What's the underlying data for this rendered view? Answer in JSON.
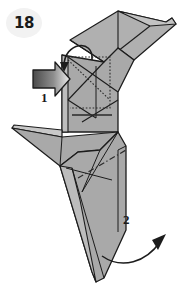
{
  "diagram": {
    "kind": "origami-folding-instruction",
    "step_badge": "18",
    "labels": [
      {
        "id": "label-1",
        "text": "1"
      },
      {
        "id": "label-2",
        "text": "2"
      }
    ],
    "icons": {
      "push_arrow": "push-arrow-icon",
      "fold_arrow": "curved-fold-arrow-icon",
      "swing_arrow": "curved-swing-arrow-icon"
    },
    "colors": {
      "background": "#ffffff",
      "paper_fill": "#a9a9a9",
      "paper_fill_light": "#b8b8b8",
      "paper_fill_dark": "#9a9a9a",
      "paper_edge": "#d8d8d8",
      "outline": "#1c1c1c",
      "crease": "#2a2a2a",
      "badge_bg": "#f2f2f2",
      "badge_text": "#1a1a1a",
      "arrow_dark": "#4a4a4a",
      "arrow_light": "#e8e8e8"
    }
  }
}
